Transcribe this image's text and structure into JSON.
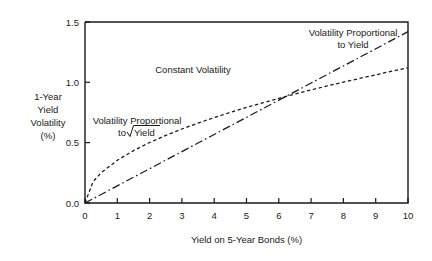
{
  "chart_data": {
    "type": "line",
    "title": "",
    "xlabel": "Yield on 5-Year Bonds (%)",
    "ylabel": "1-Year Yield Volatility (%)",
    "xlim": [
      0,
      10
    ],
    "ylim": [
      0.0,
      1.5
    ],
    "grid": false,
    "legend_position": "inline-annotations",
    "xticks": [
      "0",
      "1",
      "2",
      "3",
      "4",
      "5",
      "6",
      "7",
      "8",
      "9",
      "10"
    ],
    "xtick_values": [
      0,
      1,
      2,
      3,
      4,
      5,
      6,
      7,
      8,
      9,
      10
    ],
    "yticks": [
      "0.0",
      "0.5",
      "1.0",
      "1.5"
    ],
    "ytick_values": [
      0.0,
      0.5,
      1.0,
      1.5
    ],
    "x": [
      0,
      0.25,
      0.5,
      1,
      1.5,
      2,
      2.5,
      3,
      3.5,
      4,
      4.5,
      5,
      5.5,
      6,
      6.5,
      7,
      7.5,
      8,
      8.5,
      9,
      9.5,
      10
    ],
    "series": [
      {
        "name": "Volatility Proportional to sqrt(Yield)",
        "style": "dashed",
        "values": [
          0.0,
          0.177,
          0.251,
          0.354,
          0.434,
          0.501,
          0.56,
          0.613,
          0.662,
          0.708,
          0.751,
          0.792,
          0.83,
          0.867,
          0.903,
          0.937,
          0.97,
          1.002,
          1.032,
          1.062,
          1.092,
          1.12
        ]
      },
      {
        "name": "Volatility Proportional to Yield",
        "style": "dash-dot",
        "values": [
          0.0,
          0.0355,
          0.071,
          0.142,
          0.213,
          0.284,
          0.355,
          0.426,
          0.497,
          0.568,
          0.639,
          0.71,
          0.781,
          0.852,
          0.923,
          0.994,
          1.065,
          1.136,
          1.207,
          1.278,
          1.349,
          1.42
        ]
      }
    ],
    "annotations": [
      {
        "name": "constant-volatility",
        "text": "Constant Volatility",
        "x": 3.35,
        "y": 1.08
      },
      {
        "name": "sqrt-yield-label-line1",
        "text": "Volatility Proportional",
        "x": 1.55,
        "y": 0.64
      },
      {
        "name": "sqrt-yield-label-line2-prefix",
        "text": "to",
        "x": 1.55,
        "y": 0.555
      },
      {
        "name": "sqrt-yield-label-line2-radicand",
        "text": "Yield",
        "x": 1.55,
        "y": 0.555
      },
      {
        "name": "proportional-yield-label-line1",
        "text": "Volatility Proportional",
        "x": 8.2,
        "y": 1.4
      },
      {
        "name": "proportional-yield-label-line2",
        "text": "to Yield",
        "x": 8.2,
        "y": 1.315
      }
    ]
  },
  "axis": {
    "y_label_lines": [
      "1-Year",
      "Yield",
      "Volatility",
      "(%)"
    ],
    "x_title": "Yield on 5-Year Bonds (%)"
  },
  "annotations": {
    "constant_volatility": "Constant Volatility",
    "sqrt_line1": "Volatility Proportional",
    "sqrt_line2_prefix": "to",
    "sqrt_line2_radicand": "Yield",
    "yield_line1": "Volatility Proportional",
    "yield_line2": "to Yield"
  },
  "colors": {
    "ink": "#1a1a1a",
    "background": "#ffffff"
  }
}
